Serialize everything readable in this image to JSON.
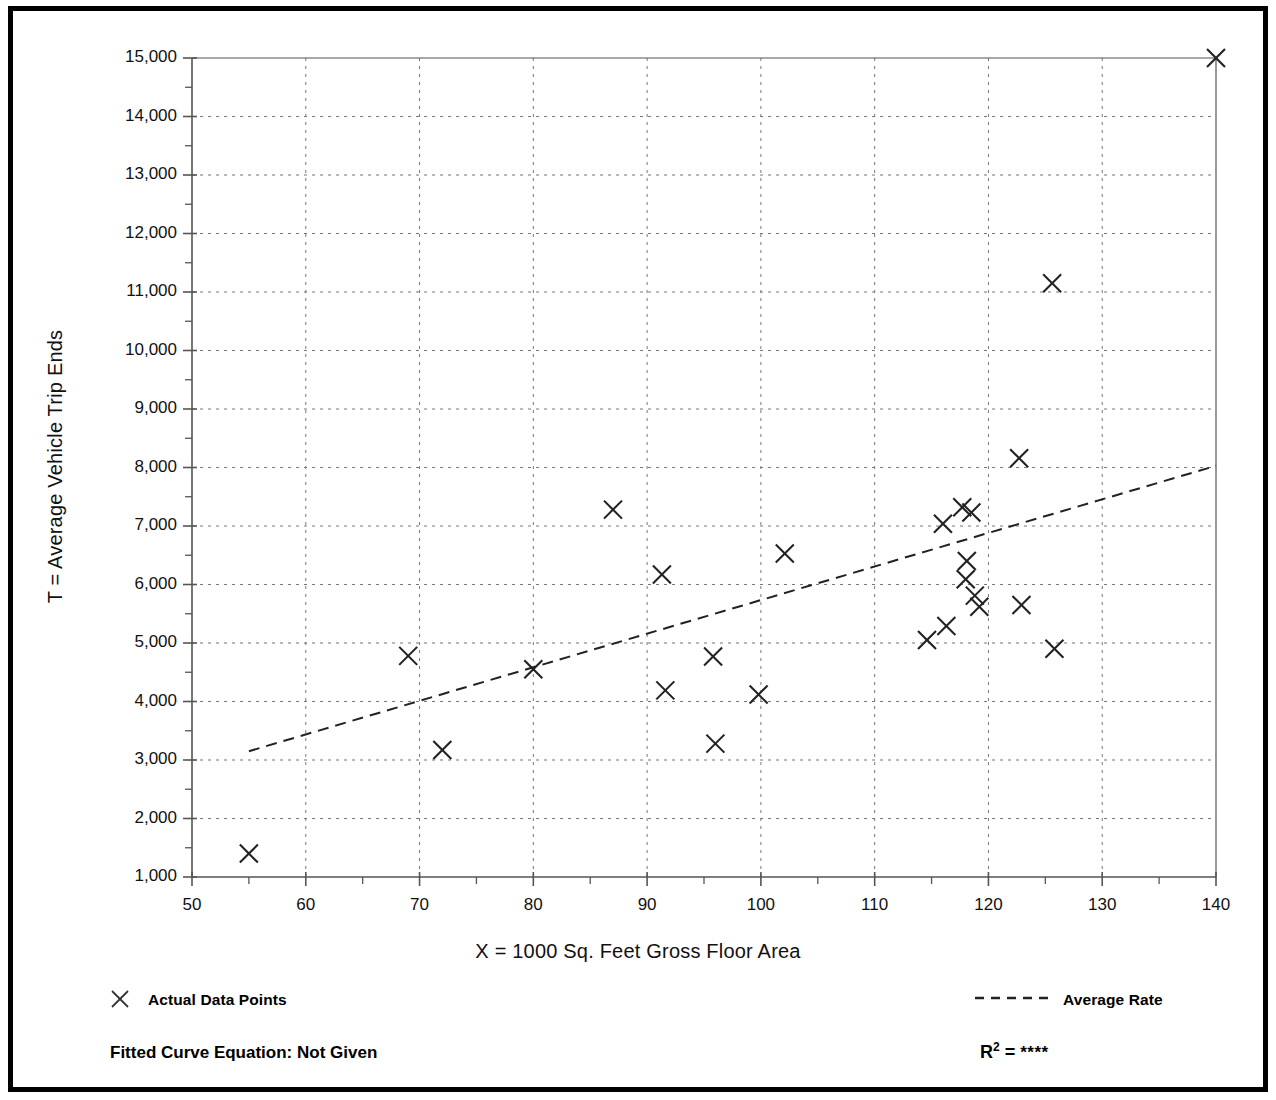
{
  "chart_data": {
    "type": "scatter",
    "title": "",
    "xlabel": "X = 1000 Sq. Feet Gross Floor Area",
    "ylabel": "T = Average Vehicle Trip Ends",
    "xlim": [
      50,
      140
    ],
    "ylim": [
      1000,
      15000
    ],
    "xticks": [
      50,
      60,
      70,
      80,
      90,
      100,
      110,
      120,
      130,
      140
    ],
    "xtick_labels": [
      "50",
      "60",
      "70",
      "80",
      "90",
      "100",
      "110",
      "120",
      "130",
      "140"
    ],
    "xminor_step": 5,
    "yticks": [
      1000,
      2000,
      3000,
      4000,
      5000,
      6000,
      7000,
      8000,
      9000,
      10000,
      11000,
      12000,
      13000,
      14000,
      15000
    ],
    "ytick_labels": [
      "1,000",
      "2,000",
      "3,000",
      "4,000",
      "5,000",
      "6,000",
      "7,000",
      "8,000",
      "9,000",
      "10,000",
      "11,000",
      "12,000",
      "13,000",
      "14,000",
      "15,000"
    ],
    "yminor_step": 500,
    "grid": "dotted",
    "legend_position": "below-axes",
    "marker": "x",
    "series": [
      {
        "name": "Actual Data Points",
        "type": "scatter",
        "marker": "x",
        "points": [
          {
            "x": 55.0,
            "y": 1400
          },
          {
            "x": 69.0,
            "y": 4780
          },
          {
            "x": 72.0,
            "y": 3170
          },
          {
            "x": 80.0,
            "y": 4550
          },
          {
            "x": 87.0,
            "y": 7280
          },
          {
            "x": 91.3,
            "y": 6170
          },
          {
            "x": 91.6,
            "y": 4190
          },
          {
            "x": 95.8,
            "y": 4770
          },
          {
            "x": 96.0,
            "y": 3280
          },
          {
            "x": 99.8,
            "y": 4120
          },
          {
            "x": 102.1,
            "y": 6530
          },
          {
            "x": 114.6,
            "y": 5050
          },
          {
            "x": 116.0,
            "y": 7040
          },
          {
            "x": 116.3,
            "y": 5290
          },
          {
            "x": 117.7,
            "y": 7320
          },
          {
            "x": 118.1,
            "y": 6400
          },
          {
            "x": 118.0,
            "y": 6090
          },
          {
            "x": 118.5,
            "y": 7230
          },
          {
            "x": 118.8,
            "y": 5810
          },
          {
            "x": 119.2,
            "y": 5620
          },
          {
            "x": 122.7,
            "y": 8160
          },
          {
            "x": 122.9,
            "y": 5650
          },
          {
            "x": 125.6,
            "y": 11150
          },
          {
            "x": 125.8,
            "y": 4900
          },
          {
            "x": 140.0,
            "y": 15000
          }
        ]
      },
      {
        "name": "Average Rate",
        "type": "line",
        "style": "dashed",
        "points": [
          {
            "x": 55.0,
            "y": 3150
          },
          {
            "x": 140.0,
            "y": 8030
          }
        ]
      }
    ]
  },
  "legend": {
    "points_label": "Actual Data Points",
    "line_label": "Average Rate",
    "marker_icon": "x-marker-icon",
    "line_icon": "dashed-line-icon"
  },
  "footer": {
    "fitted_curve_equation": "Fitted Curve Equation:  Not Given",
    "r2_symbol": "R",
    "r2_exponent": "2",
    "r2_equals": " = ",
    "r2_value": "****"
  },
  "colors": {
    "frame": "#000000",
    "axis": "#555555",
    "grid": "#777777",
    "marker": "#222222",
    "text": "#111111"
  }
}
